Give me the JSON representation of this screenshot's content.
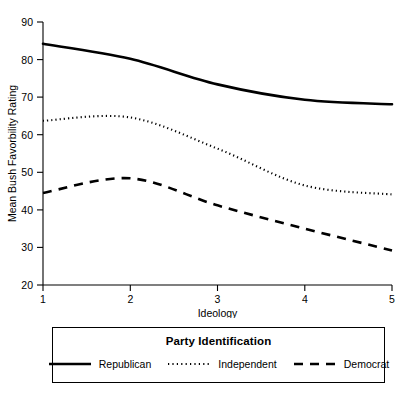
{
  "chart_data": {
    "type": "line",
    "title": "",
    "xlabel": "Ideology",
    "ylabel": "Mean Bush Favorbility Rating",
    "x": [
      1,
      2,
      3,
      4,
      5
    ],
    "xticklabels": [
      "1",
      "2",
      "3",
      "4",
      "5"
    ],
    "yticklabels": [
      "20",
      "30",
      "40",
      "50",
      "60",
      "70",
      "80",
      "90"
    ],
    "yticks": [
      20,
      30,
      40,
      50,
      60,
      70,
      80,
      90
    ],
    "xlim": [
      1,
      5
    ],
    "ylim": [
      20,
      90
    ],
    "grid": false,
    "legend_position": "below-plot",
    "legend_title": "Party Identification",
    "series": [
      {
        "name": "Republican",
        "style": "solid",
        "values": [
          84.2,
          80.2,
          73.4,
          69.3,
          68.1
        ]
      },
      {
        "name": "Independent",
        "style": "dotted",
        "values": [
          63.7,
          64.6,
          56.3,
          46.5,
          44.1
        ]
      },
      {
        "name": "Democrat",
        "style": "dashed",
        "values": [
          44.5,
          48.4,
          41.2,
          35.0,
          29.2
        ]
      }
    ]
  },
  "axes": {
    "y_label": "Mean Bush Favorbility Rating",
    "x_label": "Ideology",
    "y_ticks": [
      "90",
      "80",
      "70",
      "60",
      "50",
      "40",
      "30",
      "20"
    ],
    "x_ticks": [
      "1",
      "2",
      "3",
      "4",
      "5"
    ]
  },
  "legend": {
    "title": "Party Identification",
    "items": [
      {
        "label": "Republican",
        "style": "solid"
      },
      {
        "label": "Independent",
        "style": "dotted"
      },
      {
        "label": "Democrat",
        "style": "dashed"
      }
    ]
  },
  "colors": {
    "line": "#000000",
    "axis": "#000000",
    "background": "#ffffff"
  }
}
